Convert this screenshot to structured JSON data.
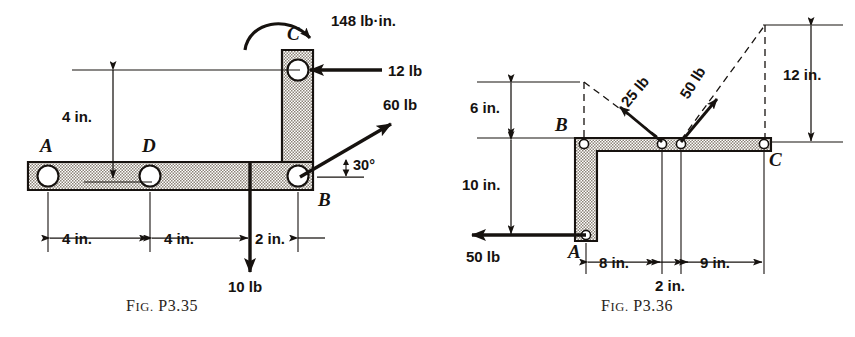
{
  "page": {
    "background": "#ffffff",
    "ink": "#16120f"
  },
  "figures": [
    {
      "id": "fig-p335",
      "caption_prefix": "F",
      "caption_smallcaps": "IG.",
      "caption_number": "P3.35",
      "caption_full": "FIG. P3.35",
      "points": [
        {
          "name": "A",
          "label": "A"
        },
        {
          "name": "D",
          "label": "D"
        },
        {
          "name": "B",
          "label": "B"
        },
        {
          "name": "C",
          "label": "C"
        }
      ],
      "forces": [
        {
          "name": "moment-at-c",
          "label": "148 lb·in.",
          "magnitude": 148,
          "unit": "lb·in.",
          "type": "moment",
          "sense": "clockwise"
        },
        {
          "name": "force-12lb",
          "label": "12 lb",
          "magnitude": 12,
          "unit": "lb",
          "direction": "left",
          "angle_deg": 180
        },
        {
          "name": "force-60lb",
          "label": "60 lb",
          "magnitude": 60,
          "unit": "lb",
          "direction": "up-right",
          "angle_deg": 30
        },
        {
          "name": "force-10lb",
          "label": "10 lb",
          "magnitude": 10,
          "unit": "lb",
          "direction": "down",
          "angle_deg": 270
        }
      ],
      "angles": [
        {
          "name": "angle-at-b",
          "label": "30°",
          "value": 30,
          "unit": "deg"
        }
      ],
      "dimensions": [
        {
          "name": "dim-vertical-4in",
          "label": "4 in.",
          "value": 4,
          "unit": "in.",
          "orientation": "vertical"
        },
        {
          "name": "dim-a-to-d",
          "label": "4 in.",
          "value": 4,
          "unit": "in.",
          "orientation": "horizontal"
        },
        {
          "name": "dim-d-to-load",
          "label": "4 in.",
          "value": 4,
          "unit": "in.",
          "orientation": "horizontal"
        },
        {
          "name": "dim-load-to-b",
          "label": "2 in.",
          "value": 2,
          "unit": "in.",
          "orientation": "horizontal"
        }
      ]
    },
    {
      "id": "fig-p336",
      "caption_prefix": "F",
      "caption_smallcaps": "IG.",
      "caption_number": "P3.36",
      "caption_full": "FIG. P3.36",
      "points": [
        {
          "name": "A",
          "label": "A"
        },
        {
          "name": "B",
          "label": "B"
        },
        {
          "name": "C",
          "label": "C"
        }
      ],
      "forces": [
        {
          "name": "force-25lb",
          "label": "25 lb",
          "magnitude": 25,
          "unit": "lb",
          "direction": "up-left"
        },
        {
          "name": "force-50lb-right",
          "label": "50 lb",
          "magnitude": 50,
          "unit": "lb",
          "direction": "up-right"
        },
        {
          "name": "force-50lb-left",
          "label": "50 lb",
          "magnitude": 50,
          "unit": "lb",
          "direction": "left",
          "angle_deg": 180
        }
      ],
      "dimensions": [
        {
          "name": "dim-6in",
          "label": "6 in.",
          "value": 6,
          "unit": "in.",
          "orientation": "vertical"
        },
        {
          "name": "dim-10in",
          "label": "10 in.",
          "value": 10,
          "unit": "in.",
          "orientation": "vertical"
        },
        {
          "name": "dim-12in",
          "label": "12 in.",
          "value": 12,
          "unit": "in.",
          "orientation": "vertical"
        },
        {
          "name": "dim-8in",
          "label": "8 in.",
          "value": 8,
          "unit": "in.",
          "orientation": "horizontal"
        },
        {
          "name": "dim-2in",
          "label": "2 in.",
          "value": 2,
          "unit": "in.",
          "orientation": "horizontal"
        },
        {
          "name": "dim-9in",
          "label": "9 in.",
          "value": 9,
          "unit": "in.",
          "orientation": "horizontal"
        }
      ]
    }
  ]
}
